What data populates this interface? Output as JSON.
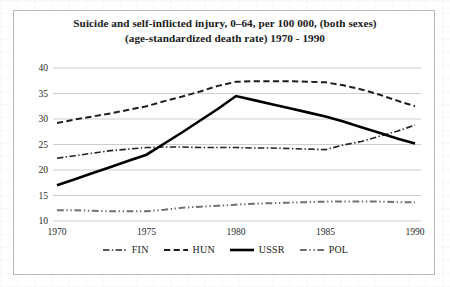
{
  "chart_data": {
    "type": "line",
    "title": "Suicide and self-inflicted injury, 0–64, per 100 000, (both sexes)",
    "subtitle": "(age-standardized death rate) 1970 - 1990",
    "xlabel": "",
    "ylabel": "",
    "xlim": [
      1970,
      1990
    ],
    "ylim": [
      10,
      40
    ],
    "grid": true,
    "legend_position": "bottom",
    "xtick_labels": [
      "1970",
      "1975",
      "1980",
      "1985",
      "1990"
    ],
    "ytick_labels": [
      "40",
      "35",
      "30",
      "25",
      "20",
      "15",
      "10"
    ],
    "xticks": [
      1970,
      1975,
      1980,
      1985,
      1990
    ],
    "yticks": [
      40,
      35,
      30,
      25,
      20,
      15,
      10
    ],
    "x": [
      1970,
      1971,
      1972,
      1973,
      1974,
      1975,
      1976,
      1977,
      1978,
      1979,
      1980,
      1981,
      1982,
      1983,
      1984,
      1985,
      1986,
      1987,
      1988,
      1989,
      1990
    ],
    "series": [
      {
        "name": "FIN",
        "style": "dash-dot",
        "color": "#232323",
        "width": 1.6,
        "values": [
          22.3,
          22.8,
          23.3,
          23.8,
          24.1,
          24.4,
          24.5,
          24.5,
          24.4,
          24.4,
          24.4,
          24.3,
          24.3,
          24.2,
          24.1,
          24.0,
          24.9,
          25.6,
          26.6,
          27.6,
          28.8
        ]
      },
      {
        "name": "HUN",
        "style": "dashed",
        "color": "#1d1d1d",
        "width": 2.0,
        "values": [
          29.2,
          29.9,
          30.5,
          31.1,
          31.8,
          32.5,
          33.5,
          34.4,
          35.4,
          36.5,
          37.3,
          37.4,
          37.4,
          37.4,
          37.3,
          37.2,
          36.6,
          35.8,
          34.8,
          33.6,
          32.5
        ]
      },
      {
        "name": "USSR",
        "style": "solid",
        "color": "#000000",
        "width": 2.6,
        "values": [
          17.0,
          18.2,
          19.4,
          20.6,
          21.8,
          23.0,
          25.2,
          27.4,
          29.7,
          32.0,
          34.5,
          33.7,
          32.9,
          32.1,
          31.3,
          30.5,
          29.5,
          28.4,
          27.3,
          26.2,
          25.2
        ]
      },
      {
        "name": "POL",
        "style": "dash-dot-dot",
        "color": "#707070",
        "width": 2.0,
        "values": [
          12.1,
          12.1,
          12.0,
          11.9,
          11.9,
          11.9,
          12.2,
          12.6,
          12.8,
          13.0,
          13.2,
          13.4,
          13.5,
          13.6,
          13.7,
          13.8,
          13.8,
          13.8,
          13.8,
          13.7,
          13.7
        ]
      }
    ],
    "legend_entries": [
      "FIN",
      "HUN",
      "USSR",
      "POL"
    ]
  }
}
